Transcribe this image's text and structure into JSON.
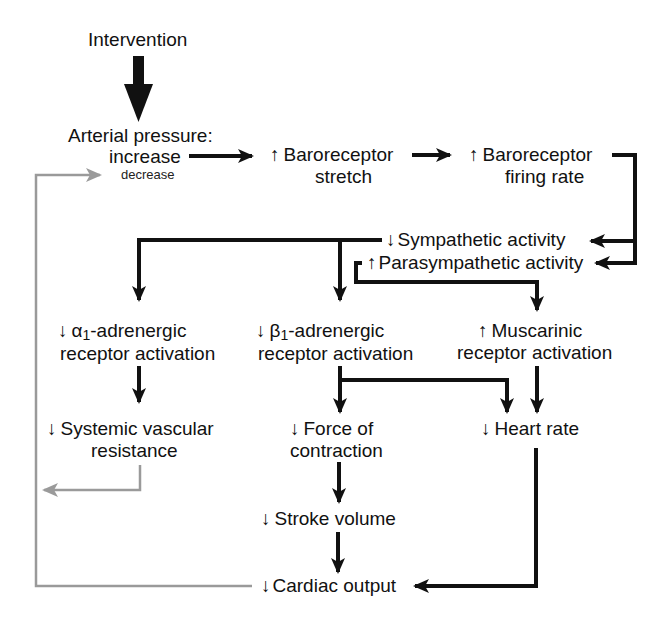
{
  "diagram": {
    "colors": {
      "main": "#111111",
      "feedback": "#9a9a9a",
      "background": "#ffffff"
    },
    "nodes": {
      "intervention": {
        "label": "Intervention"
      },
      "arterial_pressure": {
        "line1": "Arterial pressure:",
        "line2": "increase",
        "line3": "decrease"
      },
      "baro_stretch": {
        "arrow": "↑",
        "line1": "Baroreceptor",
        "line2": "stretch"
      },
      "baro_firing": {
        "arrow": "↑",
        "line1": "Baroreceptor",
        "line2": "firing rate"
      },
      "sympathetic": {
        "arrow": "↓",
        "label": "Sympathetic activity"
      },
      "parasympathetic": {
        "arrow": "↑",
        "label": "Parasympathetic activity"
      },
      "alpha1": {
        "arrow": "↓",
        "greek": "α",
        "sub": "1",
        "line1_rest": "-adrenergic",
        "line2": "receptor activation"
      },
      "beta1": {
        "arrow": "↓",
        "greek": "β",
        "sub": "1",
        "line1_rest": "-adrenergic",
        "line2": "receptor activation"
      },
      "muscarinic": {
        "arrow": "↑",
        "line1": "Muscarinic",
        "line2": "receptor activation"
      },
      "svr": {
        "arrow": "↓",
        "line1": "Systemic vascular",
        "line2": "resistance"
      },
      "force": {
        "arrow": "↓",
        "line1": "Force of",
        "line2": "contraction"
      },
      "heart_rate": {
        "arrow": "↓",
        "label": "Heart rate"
      },
      "stroke_volume": {
        "arrow": "↓",
        "label": "Stroke volume"
      },
      "cardiac_output": {
        "arrow": "↓",
        "label": "Cardiac output"
      }
    },
    "edges": [
      {
        "from": "intervention",
        "to": "arterial_pressure"
      },
      {
        "from": "arterial_pressure",
        "to": "baro_stretch"
      },
      {
        "from": "baro_stretch",
        "to": "baro_firing"
      },
      {
        "from": "baro_firing",
        "to": "sympathetic"
      },
      {
        "from": "baro_firing",
        "to": "parasympathetic"
      },
      {
        "from": "sympathetic",
        "to": "alpha1"
      },
      {
        "from": "sympathetic",
        "to": "beta1"
      },
      {
        "from": "parasympathetic",
        "to": "muscarinic"
      },
      {
        "from": "alpha1",
        "to": "svr"
      },
      {
        "from": "beta1",
        "to": "force"
      },
      {
        "from": "beta1",
        "to": "heart_rate"
      },
      {
        "from": "muscarinic",
        "to": "heart_rate"
      },
      {
        "from": "force",
        "to": "stroke_volume"
      },
      {
        "from": "stroke_volume",
        "to": "cardiac_output"
      },
      {
        "from": "heart_rate",
        "to": "cardiac_output"
      },
      {
        "from": "svr",
        "to": "arterial_pressure",
        "style": "feedback"
      },
      {
        "from": "cardiac_output",
        "to": "arterial_pressure",
        "style": "feedback"
      }
    ]
  }
}
